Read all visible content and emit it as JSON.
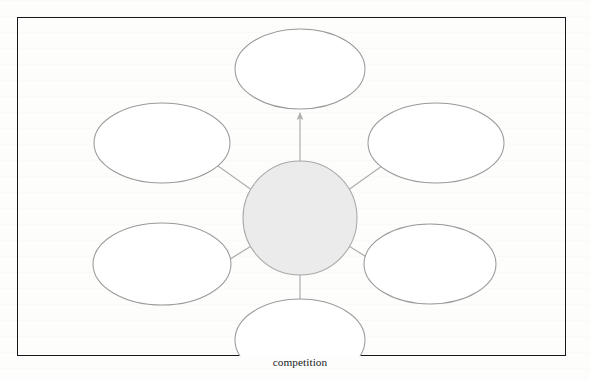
{
  "figure": {
    "type": "hub-and-spoke radial diagram",
    "hub": {
      "label": "Government Protection of Canadian Business",
      "lines": [
        "Government",
        "Protection of",
        "Canadian",
        "Business"
      ],
      "fill_color": "#ebebeb",
      "stroke_color": "#a8a8a8"
    },
    "spokes": [
      {
        "id": "nurturing-young-industries",
        "label": "Nurturing young industries",
        "lines": [
          "Nurturing",
          "young",
          "industries"
        ],
        "direction": "top"
      },
      {
        "id": "encouraging-direct-foreign-investment",
        "label": "Encouraging direct foreign investment",
        "lines": [
          "Encouraging",
          "direct foreign",
          "investment"
        ],
        "direction": "top-right"
      },
      {
        "id": "maintaining-favourable-balance-of-trade",
        "label": "Maintaining favourable balance of trade",
        "lines": [
          "Maintaining",
          "favourable",
          "balance of trade"
        ],
        "direction": "bottom-right"
      },
      {
        "id": "protecting-against-unfair-global-competition",
        "label": "Protecting against unfair global competition",
        "lines": [
          "Protecting",
          "against unfair",
          "global",
          "competition"
        ],
        "direction": "bottom"
      },
      {
        "id": "maintaining-adequate-levels-of-domestic-employment",
        "label": "Maintaining adequate levels of domestic employment",
        "lines": [
          "Maintaining",
          "adequate levels of",
          "domestic",
          "employment"
        ],
        "direction": "bottom-left"
      },
      {
        "id": "offering-subsidies-to-compete-globally",
        "label": "Offering subsidies to compete globally",
        "lines": [
          "Offering",
          "subsidies to",
          "compete globally"
        ],
        "direction": "top-left"
      }
    ],
    "ellipse_fill": "#ffffff",
    "ellipse_stroke": "#9a9a9a",
    "arrow_color": "#b0b0b0",
    "frame_color": "#15161a",
    "page_background": "#fdfdfc"
  },
  "caption": {
    "text": ""
  }
}
